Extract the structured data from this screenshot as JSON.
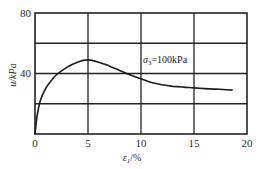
{
  "chart_data": {
    "type": "line",
    "title": "",
    "xlabel": "ε₁/%",
    "ylabel": "u/kPa",
    "xlim": [
      0,
      20
    ],
    "ylim": [
      0,
      80
    ],
    "xticks": [
      "0",
      "5",
      "10",
      "15",
      "20"
    ],
    "yticks": [
      "40",
      "80"
    ],
    "grid": true,
    "legend": null,
    "annotations": [
      {
        "text": "σ₃=100kPa",
        "x": 10.5,
        "y": 54
      }
    ],
    "series": [
      {
        "name": "σ3=100kPa",
        "x": [
          0,
          0.2,
          0.5,
          1,
          1.5,
          2,
          3,
          4,
          5,
          6,
          7,
          8,
          9,
          10,
          11,
          12,
          13,
          14,
          15,
          16,
          17,
          18,
          18.6
        ],
        "y": [
          0,
          12,
          22,
          30,
          35,
          39,
          44,
          47.5,
          49,
          47.5,
          45,
          42,
          39,
          36.5,
          34,
          32.5,
          31.5,
          31,
          30.5,
          30,
          29.7,
          29.3,
          29
        ]
      }
    ]
  },
  "labels": {
    "y_axis": "u/kPa",
    "x_axis_main": "ε",
    "x_axis_sub": "1",
    "x_axis_unit": "/%",
    "annotation_main": "σ",
    "annotation_sub": "3",
    "annotation_rest": "=100kPa",
    "ytick_80": "80",
    "ytick_40": "40",
    "xtick_0": "0",
    "xtick_5": "5",
    "xtick_10": "10",
    "xtick_15": "15",
    "xtick_20": "20"
  }
}
